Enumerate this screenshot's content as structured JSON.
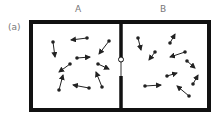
{
  "figure_label": "(a)",
  "chambers": [
    {
      "label": "A",
      "molecules": [
        {
          "x": 53,
          "y": 42,
          "tx": 55,
          "ty": 57
        },
        {
          "x": 87,
          "y": 38,
          "tx": 71,
          "ty": 40
        },
        {
          "x": 109,
          "y": 41,
          "tx": 99,
          "ty": 54
        },
        {
          "x": 77,
          "y": 58,
          "tx": 90,
          "ty": 57
        },
        {
          "x": 70,
          "y": 64,
          "tx": 59,
          "ty": 72
        },
        {
          "x": 98,
          "y": 64,
          "tx": 109,
          "ty": 69
        },
        {
          "x": 59,
          "y": 90,
          "tx": 63,
          "ty": 75
        },
        {
          "x": 89,
          "y": 88,
          "tx": 73,
          "ty": 85
        },
        {
          "x": 102,
          "y": 87,
          "tx": 96,
          "ty": 72
        }
      ]
    },
    {
      "label": "B",
      "molecules": [
        {
          "x": 138,
          "y": 38,
          "tx": 141,
          "ty": 50
        },
        {
          "x": 170,
          "y": 43,
          "tx": 175,
          "ty": 34
        },
        {
          "x": 155,
          "y": 52,
          "tx": 149,
          "ty": 60
        },
        {
          "x": 185,
          "y": 52,
          "tx": 170,
          "ty": 57
        },
        {
          "x": 187,
          "y": 61,
          "tx": 195,
          "ty": 68
        },
        {
          "x": 167,
          "y": 76,
          "tx": 177,
          "ty": 73
        },
        {
          "x": 193,
          "y": 84,
          "tx": 198,
          "ty": 75
        },
        {
          "x": 145,
          "y": 86,
          "tx": 161,
          "ty": 85
        },
        {
          "x": 189,
          "y": 96,
          "tx": 177,
          "ty": 86
        }
      ]
    }
  ],
  "valve": {
    "state": "closed",
    "cx": 121,
    "cy": 60
  },
  "colors": {
    "wall": "#111111",
    "molecule": "#222222",
    "label": "#777777"
  }
}
